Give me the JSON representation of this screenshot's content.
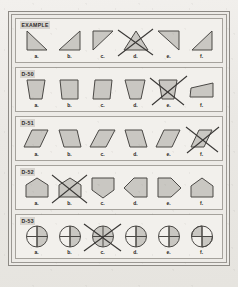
{
  "page": {
    "background_color": "#eceae6",
    "frame_border_color": "#8d8a85",
    "row_background_color": "#f2f0ec"
  },
  "shape_style": {
    "fill_color": "#c9c7c2",
    "stroke_color": "#4a4845",
    "strike_color": "#3a3836"
  },
  "rows": [
    {
      "label": "EXAMPLE",
      "crossed_out": "d",
      "items": [
        {
          "letter": "a.",
          "shape": "right-triangle-down-left"
        },
        {
          "letter": "b.",
          "shape": "right-triangle-down-right"
        },
        {
          "letter": "c.",
          "shape": "right-triangle-up-right"
        },
        {
          "letter": "d.",
          "shape": "right-triangle-up-left"
        },
        {
          "letter": "e.",
          "shape": "right-triangle-top-left"
        },
        {
          "letter": "f.",
          "shape": "right-triangle-bottom-right"
        }
      ]
    },
    {
      "label": "D-50",
      "crossed_out": "e",
      "items": [
        {
          "letter": "a.",
          "shape": "trapezoid-narrow-bottom"
        },
        {
          "letter": "b.",
          "shape": "trapezoid-slanted-right"
        },
        {
          "letter": "c.",
          "shape": "trapezoid-slanted-left"
        },
        {
          "letter": "d.",
          "shape": "trapezoid-narrow-bottom-2"
        },
        {
          "letter": "e.",
          "shape": "trapezoid-narrow-bottom-3"
        },
        {
          "letter": "f.",
          "shape": "trapezoid-rotated-flat"
        }
      ]
    },
    {
      "label": "D-51",
      "crossed_out": "f",
      "items": [
        {
          "letter": "a.",
          "shape": "parallelogram-right-lean"
        },
        {
          "letter": "b.",
          "shape": "parallelogram-left-lean"
        },
        {
          "letter": "c.",
          "shape": "parallelogram-right-lean-2"
        },
        {
          "letter": "d.",
          "shape": "parallelogram-left-lean-2"
        },
        {
          "letter": "e.",
          "shape": "parallelogram-right-lean-3"
        },
        {
          "letter": "f.",
          "shape": "parallelogram-narrow"
        }
      ]
    },
    {
      "label": "D-52",
      "crossed_out": "b",
      "items": [
        {
          "letter": "a.",
          "shape": "pentagon-point-up"
        },
        {
          "letter": "b.",
          "shape": "pentagon-point-up-2"
        },
        {
          "letter": "c.",
          "shape": "pentagon-point-down"
        },
        {
          "letter": "d.",
          "shape": "pentagon-point-left"
        },
        {
          "letter": "e.",
          "shape": "pentagon-point-right"
        },
        {
          "letter": "f.",
          "shape": "pentagon-point-up-3"
        }
      ]
    },
    {
      "label": "D-53",
      "crossed_out": "c",
      "items": [
        {
          "letter": "a.",
          "shape": "circle-quarters-right-half"
        },
        {
          "letter": "b.",
          "shape": "circle-quarters-right-half-2"
        },
        {
          "letter": "c.",
          "shape": "circle-quarters-spoked"
        },
        {
          "letter": "d.",
          "shape": "circle-quarters-left-half"
        },
        {
          "letter": "e.",
          "shape": "circle-quarters-lower-left"
        },
        {
          "letter": "f.",
          "shape": "circle-quarters-upper-right"
        }
      ]
    }
  ]
}
